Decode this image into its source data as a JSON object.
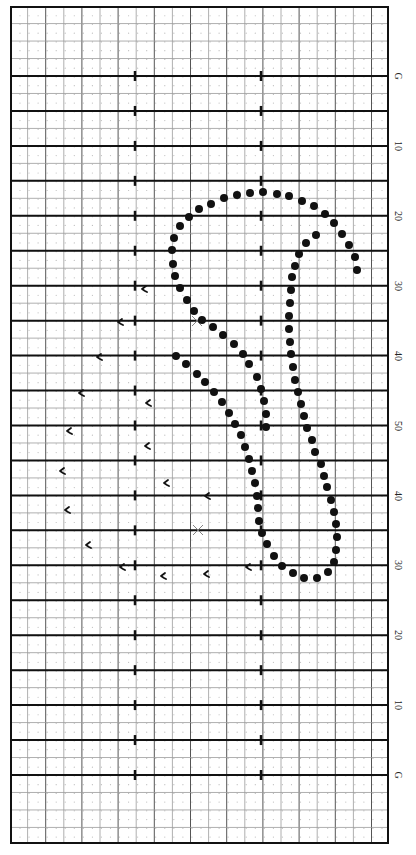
{
  "diagram": {
    "type": "marching-band drill chart",
    "field": {
      "left": 11,
      "right": 388,
      "top": 7,
      "bottom": 843,
      "yard_line_spacing_px": 34.95,
      "goal_line_top_y": 76,
      "goal_line_bottom_y": 775,
      "hash_x": [
        135,
        261
      ],
      "line_color": "#111111",
      "grid_color": "#8a8a8a",
      "dot_grid_color": "#bdbdbd"
    },
    "yard_labels": [
      {
        "text": "G",
        "y": 76
      },
      {
        "text": "10",
        "y": 146
      },
      {
        "text": "20",
        "y": 216
      },
      {
        "text": "30",
        "y": 286
      },
      {
        "text": "40",
        "y": 356
      },
      {
        "text": "50",
        "y": 426
      },
      {
        "text": "40",
        "y": 496
      },
      {
        "text": "30",
        "y": 565
      },
      {
        "text": "20",
        "y": 635
      },
      {
        "text": "10",
        "y": 705
      },
      {
        "text": "G",
        "y": 775
      }
    ],
    "label_x": 398,
    "performer_dots": {
      "color": "#111111",
      "radius": 4,
      "outer_strand": [
        [
          357,
          270
        ],
        [
          355,
          257
        ],
        [
          349,
          245
        ],
        [
          342,
          234
        ],
        [
          334,
          223
        ],
        [
          325,
          214
        ],
        [
          314,
          206
        ],
        [
          302,
          201
        ],
        [
          289,
          196
        ],
        [
          277,
          194
        ],
        [
          263,
          192
        ],
        [
          250,
          193
        ],
        [
          237,
          195
        ],
        [
          224,
          198
        ],
        [
          211,
          204
        ],
        [
          199,
          209
        ],
        [
          189,
          217
        ],
        [
          180,
          226
        ],
        [
          174,
          238
        ],
        [
          172,
          250
        ],
        [
          173,
          264
        ],
        [
          175,
          276
        ],
        [
          180,
          288
        ],
        [
          187,
          300
        ],
        [
          194,
          311
        ],
        [
          202,
          320
        ],
        [
          213,
          327
        ],
        [
          223,
          335
        ],
        [
          234,
          344
        ],
        [
          243,
          354
        ],
        [
          249,
          364
        ],
        [
          257,
          377
        ],
        [
          261,
          389
        ],
        [
          264,
          401
        ],
        [
          266,
          414
        ],
        [
          266,
          427
        ]
      ],
      "inner_strand": [
        [
          316,
          235
        ],
        [
          306,
          243
        ],
        [
          299,
          254
        ],
        [
          295,
          266
        ],
        [
          292,
          277
        ],
        [
          291,
          290
        ],
        [
          290,
          303
        ],
        [
          289,
          316
        ],
        [
          289,
          329
        ],
        [
          290,
          342
        ],
        [
          291,
          354
        ],
        [
          293,
          367
        ],
        [
          295,
          380
        ],
        [
          298,
          392
        ],
        [
          301,
          404
        ],
        [
          304,
          416
        ],
        [
          307,
          428
        ],
        [
          312,
          440
        ],
        [
          315,
          452
        ],
        [
          321,
          464
        ],
        [
          324,
          476
        ],
        [
          327,
          487
        ],
        [
          331,
          500
        ],
        [
          334,
          512
        ],
        [
          336,
          524
        ],
        [
          337,
          537
        ],
        [
          336,
          550
        ],
        [
          334,
          562
        ],
        [
          328,
          572
        ],
        [
          317,
          578
        ],
        [
          304,
          578
        ],
        [
          293,
          573
        ],
        [
          282,
          566
        ],
        [
          274,
          556
        ],
        [
          267,
          544
        ],
        [
          262,
          533
        ],
        [
          259,
          521
        ],
        [
          258,
          508
        ],
        [
          257,
          496
        ],
        [
          255,
          483
        ],
        [
          252,
          471
        ],
        [
          249,
          459
        ],
        [
          245,
          447
        ],
        [
          241,
          435
        ],
        [
          235,
          424
        ],
        [
          229,
          413
        ],
        [
          222,
          402
        ],
        [
          214,
          392
        ],
        [
          205,
          382
        ],
        [
          197,
          374
        ],
        [
          186,
          364
        ],
        [
          176,
          356
        ]
      ]
    },
    "hook_marks": {
      "color": "#111111",
      "points": [
        [
          144,
          289
        ],
        [
          120,
          322
        ],
        [
          99,
          357
        ],
        [
          81,
          393
        ],
        [
          148,
          403
        ],
        [
          69,
          431
        ],
        [
          147,
          446
        ],
        [
          62,
          471
        ],
        [
          166,
          483
        ],
        [
          207,
          496
        ],
        [
          67,
          510
        ],
        [
          88,
          545
        ],
        [
          122,
          567
        ],
        [
          248,
          567
        ],
        [
          163,
          576
        ],
        [
          206,
          574
        ]
      ]
    },
    "x_marks": {
      "color": "#777777",
      "points": [
        [
          197,
          321
        ],
        [
          198,
          530
        ]
      ]
    }
  }
}
